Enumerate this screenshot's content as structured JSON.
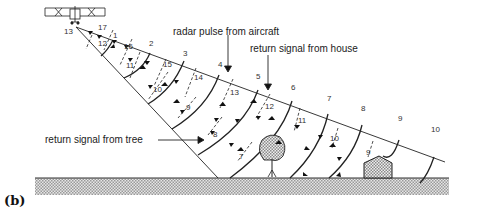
{
  "figure": {
    "caption": "(b)",
    "type": "radar pulse and return signals schematic"
  },
  "labels": {
    "radar_pulse": "radar pulse from aircraft",
    "return_house": "return signal from house",
    "return_tree": "return signal from tree"
  },
  "upper_edge_numbers": [
    "1",
    "2",
    "3",
    "4",
    "5",
    "6",
    "7",
    "8",
    "9",
    "10"
  ],
  "apex_number": "13",
  "return_numbers": {
    "near_apex": [
      "17",
      "12",
      "16",
      "11"
    ],
    "inner": [
      "15",
      "10",
      "14",
      "9",
      "13",
      "8",
      "12",
      "7",
      "11",
      "10",
      "9"
    ]
  },
  "objects": [
    "aircraft",
    "tree",
    "house",
    "ground"
  ],
  "colors": {
    "line": "#222222",
    "ground_fill": "#cfcfcf",
    "background": "#ffffff"
  }
}
